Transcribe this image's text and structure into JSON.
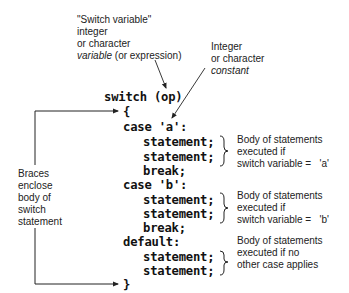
{
  "annotations": {
    "switch_variable": {
      "line1": "\"Switch variable\"",
      "line2": "integer",
      "line3": "or character",
      "line4_italic": "variable",
      "line4_rest": " (or expression)"
    },
    "case_constant": {
      "line1": "Integer",
      "line2": "or character",
      "line3_italic": "constant"
    },
    "braces": {
      "line1": "Braces",
      "line2": "enclose",
      "line3": "body of",
      "line4": "switch",
      "line5": "statement"
    },
    "case_a_body": {
      "line1": "Body of statements",
      "line2": "executed if",
      "line3": "switch variable =   'a'"
    },
    "case_b_body": {
      "line1": "Body of statements",
      "line2": "executed if",
      "line3": "switch variable =   'b'"
    },
    "default_body": {
      "line1": "Body of statements",
      "line2": "executed if no",
      "line3": "other case applies"
    }
  },
  "code": {
    "lines": [
      "switch (op)",
      "{",
      "case 'a':",
      "statement;",
      "statement;",
      "break;",
      "case 'b':",
      "statement;",
      "statement;",
      "break;",
      "default:",
      "statement;",
      "statement;",
      "}"
    ]
  }
}
